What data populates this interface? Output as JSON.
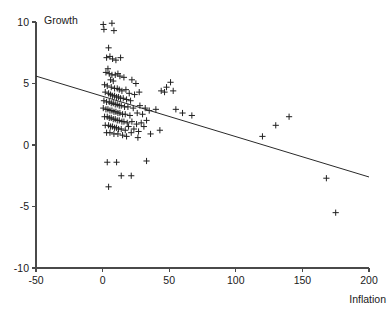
{
  "chart_data": {
    "type": "scatter",
    "title": "",
    "xlabel": "Inflation",
    "ylabel": "Growth",
    "xlim": [
      -50,
      200
    ],
    "ylim": [
      -10,
      10
    ],
    "xticks": [
      -50,
      0,
      50,
      100,
      150,
      200
    ],
    "yticks": [
      -10,
      -5,
      0,
      5,
      10
    ],
    "xtick_labels": [
      "-50",
      "0",
      "50",
      "100",
      "150",
      "200"
    ],
    "ytick_labels": [
      "-10",
      "-5",
      "0",
      "5",
      "10"
    ],
    "grid": false,
    "legend": null,
    "marker": "plus",
    "marker_color": "#202020",
    "line_color": "#2a2a2a",
    "axis_color": "#4a4a4a",
    "trendline": {
      "name": "fitted regression line",
      "x": [
        -50,
        200
      ],
      "y": [
        5.6,
        -2.6
      ],
      "slope": -0.0328,
      "intercept": 3.96
    },
    "points": [
      [
        0.5,
        9.8
      ],
      [
        7.0,
        9.9
      ],
      [
        1.0,
        9.4
      ],
      [
        8.5,
        9.3
      ],
      [
        4.5,
        7.9
      ],
      [
        3.0,
        7.1
      ],
      [
        5.5,
        7.2
      ],
      [
        7.5,
        7.0
      ],
      [
        10.0,
        6.9
      ],
      [
        13.5,
        7.1
      ],
      [
        4.0,
        6.2
      ],
      [
        2.5,
        5.9
      ],
      [
        5.0,
        5.8
      ],
      [
        7.0,
        5.7
      ],
      [
        9.5,
        5.7
      ],
      [
        11.5,
        5.8
      ],
      [
        13.0,
        5.6
      ],
      [
        16.0,
        5.5
      ],
      [
        6.0,
        5.3
      ],
      [
        8.0,
        5.2
      ],
      [
        22.0,
        5.3
      ],
      [
        25.0,
        5.0
      ],
      [
        1.5,
        4.9
      ],
      [
        3.5,
        4.8
      ],
      [
        6.5,
        4.7
      ],
      [
        9.0,
        4.6
      ],
      [
        11.0,
        4.6
      ],
      [
        12.5,
        4.5
      ],
      [
        14.5,
        4.4
      ],
      [
        17.5,
        4.5
      ],
      [
        20.0,
        4.2
      ],
      [
        24.0,
        4.1
      ],
      [
        27.5,
        4.3
      ],
      [
        2.0,
        4.3
      ],
      [
        4.5,
        4.2
      ],
      [
        6.0,
        4.1
      ],
      [
        7.5,
        4.0
      ],
      [
        9.0,
        4.0
      ],
      [
        10.5,
        3.9
      ],
      [
        12.0,
        3.9
      ],
      [
        13.5,
        3.8
      ],
      [
        15.5,
        3.8
      ],
      [
        18.0,
        3.7
      ],
      [
        21.0,
        3.6
      ],
      [
        1.0,
        3.6
      ],
      [
        3.0,
        3.5
      ],
      [
        5.0,
        3.5
      ],
      [
        6.5,
        3.4
      ],
      [
        8.0,
        3.4
      ],
      [
        9.5,
        3.3
      ],
      [
        11.0,
        3.3
      ],
      [
        12.5,
        3.2
      ],
      [
        14.0,
        3.2
      ],
      [
        16.5,
        3.1
      ],
      [
        19.0,
        3.1
      ],
      [
        23.0,
        3.0
      ],
      [
        28.0,
        3.2
      ],
      [
        32.0,
        3.0
      ],
      [
        0.5,
        3.0
      ],
      [
        2.5,
        2.9
      ],
      [
        4.0,
        2.9
      ],
      [
        5.5,
        2.8
      ],
      [
        7.0,
        2.8
      ],
      [
        8.5,
        2.7
      ],
      [
        10.0,
        2.7
      ],
      [
        11.5,
        2.6
      ],
      [
        13.0,
        2.6
      ],
      [
        15.0,
        2.5
      ],
      [
        17.0,
        2.5
      ],
      [
        20.5,
        2.4
      ],
      [
        26.0,
        2.6
      ],
      [
        30.0,
        2.5
      ],
      [
        35.0,
        2.8
      ],
      [
        40.0,
        2.9
      ],
      [
        1.5,
        2.3
      ],
      [
        3.5,
        2.3
      ],
      [
        5.0,
        2.2
      ],
      [
        6.5,
        2.2
      ],
      [
        8.0,
        2.1
      ],
      [
        9.5,
        2.1
      ],
      [
        11.0,
        2.0
      ],
      [
        12.5,
        2.0
      ],
      [
        14.5,
        1.9
      ],
      [
        16.0,
        1.9
      ],
      [
        18.5,
        1.8
      ],
      [
        22.0,
        1.9
      ],
      [
        25.5,
        1.7
      ],
      [
        29.0,
        1.8
      ],
      [
        33.0,
        2.0
      ],
      [
        2.0,
        1.6
      ],
      [
        4.5,
        1.6
      ],
      [
        6.0,
        1.5
      ],
      [
        7.5,
        1.5
      ],
      [
        9.0,
        1.4
      ],
      [
        10.5,
        1.4
      ],
      [
        12.0,
        1.3
      ],
      [
        14.0,
        1.3
      ],
      [
        17.0,
        1.2
      ],
      [
        19.5,
        1.5
      ],
      [
        23.5,
        1.3
      ],
      [
        27.0,
        1.1
      ],
      [
        31.0,
        1.5
      ],
      [
        3.0,
        1.0
      ],
      [
        5.5,
        1.0
      ],
      [
        8.5,
        0.9
      ],
      [
        11.5,
        0.9
      ],
      [
        15.0,
        0.8
      ],
      [
        18.0,
        0.7
      ],
      [
        21.5,
        1.0
      ],
      [
        26.5,
        0.6
      ],
      [
        36.0,
        0.9
      ],
      [
        43.0,
        1.2
      ],
      [
        48.0,
        4.7
      ],
      [
        51.0,
        5.1
      ],
      [
        44.0,
        4.4
      ],
      [
        46.5,
        4.3
      ],
      [
        53.0,
        4.4
      ],
      [
        55.0,
        2.9
      ],
      [
        60.0,
        2.6
      ],
      [
        67.0,
        2.4
      ],
      [
        3.5,
        -1.4
      ],
      [
        10.5,
        -1.4
      ],
      [
        33.0,
        -1.3
      ],
      [
        14.0,
        -2.5
      ],
      [
        21.5,
        -2.5
      ],
      [
        4.5,
        -3.4
      ],
      [
        120.0,
        0.7
      ],
      [
        130.0,
        1.6
      ],
      [
        140.0,
        2.3
      ],
      [
        168.0,
        -2.7
      ],
      [
        175.0,
        -5.5
      ]
    ]
  },
  "axis_labels": {
    "y_axis_title": "Growth",
    "x_axis_title": "Inflation"
  }
}
